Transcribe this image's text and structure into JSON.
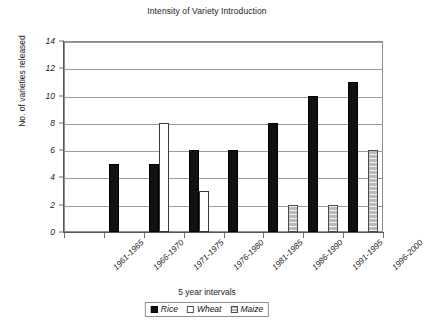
{
  "chart_data": {
    "type": "bar",
    "title": "Intensity of Variety Introduction",
    "xlabel": "5 year intervals",
    "ylabel": "No. of varieties released",
    "categories": [
      "1961-1965",
      "1966-1970",
      "1971-1975",
      "1976-1980",
      "1981-1985",
      "1986-1990",
      "1991-1995",
      "1996-2000"
    ],
    "series": [
      {
        "name": "Rice",
        "values": [
          0,
          5,
          5,
          6,
          6,
          8,
          10,
          11
        ]
      },
      {
        "name": "Wheat",
        "values": [
          0,
          0,
          8,
          3,
          0,
          0,
          0,
          0
        ]
      },
      {
        "name": "Maize",
        "values": [
          0,
          0,
          0,
          0,
          0,
          2,
          2,
          6
        ]
      }
    ],
    "ylim": [
      0,
      14
    ],
    "yticks": [
      0,
      2,
      4,
      6,
      8,
      10,
      12,
      14
    ],
    "ytick_labels": [
      "0",
      "2",
      "4",
      "6",
      "8",
      "10",
      "12",
      "14"
    ],
    "grid": true,
    "legend_position": "bottom-center"
  },
  "legend": {
    "items": [
      {
        "label": "Rice",
        "swatch": "rice-swatch-icon"
      },
      {
        "label": "Wheat",
        "swatch": "wheat-swatch-icon"
      },
      {
        "label": "Maize",
        "swatch": "maize-swatch-icon"
      }
    ]
  },
  "colors": {
    "rice": "#111111",
    "wheat": "#ffffff",
    "maize": "#b9b9b9",
    "grid": "#9a9a9a",
    "axis": "#555555",
    "text": "#1b1b1b"
  }
}
